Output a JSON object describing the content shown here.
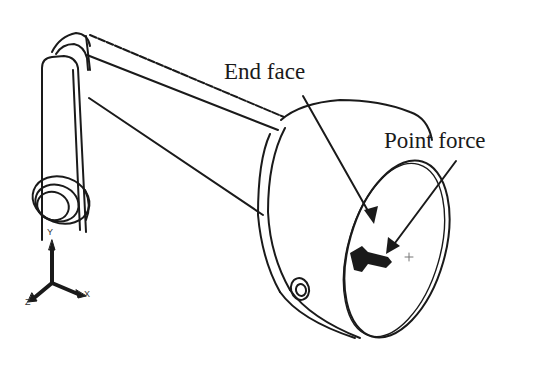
{
  "figure": {
    "labels": {
      "end_face": "End face",
      "point_force": "Point force"
    },
    "triad": {
      "y": "Y",
      "x": "X",
      "z": "Z"
    },
    "colors": {
      "line": "#1a1a1a",
      "background": "#ffffff"
    }
  }
}
